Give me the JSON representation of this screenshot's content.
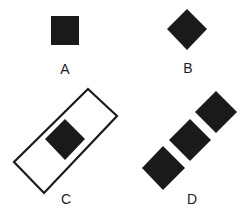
{
  "figure": {
    "colors": {
      "fill": "#1a1a1a",
      "stroke": "#1a1a1a",
      "background": "#ffffff",
      "label": "#222222"
    },
    "panels": [
      {
        "id": "A",
        "label": "A",
        "label_pos": [
          65,
          69
        ],
        "shapes": [
          {
            "type": "square",
            "points": "51,16 79,16 79,45 51,45"
          }
        ]
      },
      {
        "id": "B",
        "label": "B",
        "label_pos": [
          188,
          68
        ],
        "shapes": [
          {
            "type": "diamond",
            "points": "187,9 207,29 187,50 167,29"
          }
        ]
      },
      {
        "id": "C",
        "label": "C",
        "label_pos": [
          66,
          199
        ],
        "shapes": [
          {
            "type": "rotated-rectangle-outline",
            "points": "88,89 117,116 44,193 14,162"
          },
          {
            "type": "diamond",
            "points": "65,119 85,139 65,160 45,139"
          }
        ]
      },
      {
        "id": "D",
        "label": "D",
        "label_pos": [
          192,
          199
        ],
        "shapes": [
          {
            "type": "diamond",
            "points": "216,91 237,112 216,133 195,112"
          },
          {
            "type": "diamond",
            "points": "190,119 211,140 190,161 169,140"
          },
          {
            "type": "diamond",
            "points": "163,146 185,168 163,190 142,168"
          }
        ]
      }
    ]
  }
}
